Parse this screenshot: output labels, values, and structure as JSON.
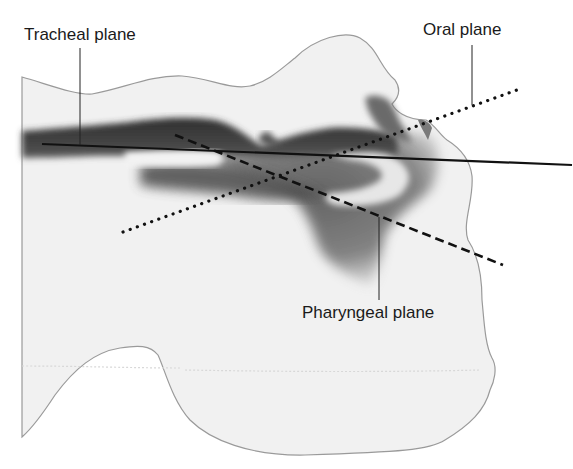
{
  "labels": {
    "tracheal": "Tracheal plane",
    "oral": "Oral plane",
    "pharyngeal": "Pharyngeal plane"
  },
  "planes": [
    {
      "name": "Tracheal plane",
      "style": "solid"
    },
    {
      "name": "Oral plane",
      "style": "dotted"
    },
    {
      "name": "Pharyngeal plane",
      "style": "dashed"
    }
  ],
  "colors": {
    "background": "#ffffff",
    "head_fill": "#f1f1f1",
    "outline": "#9a9a9a",
    "airway_dark": "#3a3a3a",
    "airway_mid": "#7a7a7a",
    "line": "#111111"
  }
}
